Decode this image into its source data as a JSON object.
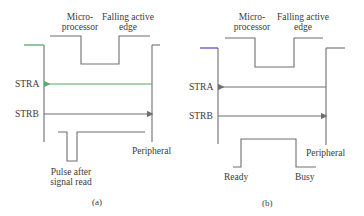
{
  "panel_a": {
    "label_micro_1": "Micro-",
    "label_micro_2": "processor",
    "label_edge_1": "Falling active",
    "label_edge_2": "edge",
    "strobe_a": "STRA",
    "strobe_b": "STRB",
    "peripheral": "Peripheral",
    "pulse_1": "Pulse after",
    "pulse_2": "signal read",
    "caption": "(a)"
  },
  "panel_b": {
    "label_micro_1": "Micro-",
    "label_micro_2": "processor",
    "label_edge_1": "Falling active",
    "label_edge_2": "edge",
    "strobe_a": "STRA",
    "strobe_b": "STRB",
    "peripheral": "Peripheral",
    "ready": "Ready",
    "busy": "Busy",
    "caption": "(b)"
  },
  "colors": {
    "line": "#6e6e6e",
    "stra_arrow_a": "#5aa86a",
    "accent_a_top": "#3e9a5a",
    "accent_b_top": "#3a3ad0"
  }
}
